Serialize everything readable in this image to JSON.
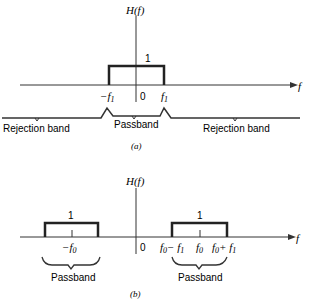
{
  "figure_a": {
    "y_label": "H(f)",
    "x_label": "f",
    "height_label": "1",
    "origin_label": "0",
    "ticks": [
      "−f",
      "f"
    ],
    "tick_subscripts": [
      "1",
      "1"
    ],
    "bands": [
      "Rejection band",
      "Passband",
      "Rejection band"
    ],
    "caption": "(a)"
  },
  "figure_b": {
    "y_label": "H(f)",
    "x_label": "f",
    "height_labels": [
      "1",
      "1"
    ],
    "origin_label": "0",
    "tick_neg": "−f",
    "tick_neg_sub": "0",
    "tick_right": [
      "f",
      "− f",
      "f",
      "f",
      "+ f"
    ],
    "tick_right_subs": [
      "0",
      "1",
      "0",
      "0",
      "1"
    ],
    "bands": [
      "Passband",
      "Passband"
    ],
    "caption": "(b)"
  }
}
